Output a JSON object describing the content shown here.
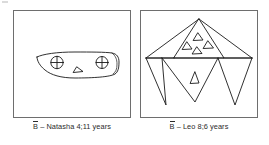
{
  "figure": {
    "background_color": "#ffffff",
    "stroke_color": "#1a1a1a",
    "frame_color": "#6e6e6e",
    "panel_count": 2
  },
  "panels": [
    {
      "id": "panel-left",
      "drawing_name": "natasha-drawing",
      "description": "Rounded blob / flat-bottomed curved shape containing two circles with inscribed crosses and one small triangle",
      "caption": {
        "symbol": "B",
        "symbol_overbar": true,
        "text": "B̄ – Natasha 4;11 years",
        "child_name": "Natasha",
        "age": "4;11 years"
      },
      "shapes": {
        "crossed_circles": 2,
        "small_triangles": 1
      }
    },
    {
      "id": "panel-right",
      "drawing_name": "leo-drawing",
      "description": "Large triangle with four small triangles inside, horizontal baseline with three downward spikes and one downward triangle containing a small triangle",
      "caption": {
        "symbol": "B",
        "symbol_overbar": true,
        "text": "B̄ – Leo 8;6 years",
        "child_name": "Leo",
        "age": "8;6 years"
      },
      "shapes": {
        "large_triangles": 1,
        "small_triangles_in_top": 4,
        "small_triangles_in_bottom": 1,
        "downward_spikes": 3
      }
    }
  ],
  "captions": {
    "left": "B̄ – Natasha 4;11 years",
    "right": "B̄ – Leo 8;6 years",
    "left_prefix": "B",
    "left_rest": " – Natasha 4;11 years",
    "right_prefix": "B",
    "right_rest": " – Leo 8;6 years"
  }
}
